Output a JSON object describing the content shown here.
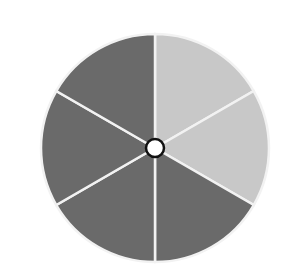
{
  "diagram": {
    "type": "sector-wheel",
    "center": [
      155,
      148
    ],
    "radius": 114,
    "sectors": [
      {
        "index": 0,
        "start_deg": -90,
        "end_deg": -30,
        "color": "#c8c8c8",
        "shade": "light"
      },
      {
        "index": 1,
        "start_deg": -30,
        "end_deg": 30,
        "color": "#c8c8c8",
        "shade": "light"
      },
      {
        "index": 2,
        "start_deg": 30,
        "end_deg": 90,
        "color": "#6a6a6a",
        "shade": "dark"
      },
      {
        "index": 3,
        "start_deg": 90,
        "end_deg": 150,
        "color": "#6a6a6a",
        "shade": "dark"
      },
      {
        "index": 4,
        "start_deg": 150,
        "end_deg": 210,
        "color": "#6a6a6a",
        "shade": "dark"
      },
      {
        "index": 5,
        "start_deg": 210,
        "end_deg": 270,
        "color": "#6a6a6a",
        "shade": "dark"
      }
    ],
    "divider_color": "#f2f2f2",
    "hub": {
      "radius": 9,
      "fill": "#ffffff",
      "stroke": "#111111"
    }
  }
}
